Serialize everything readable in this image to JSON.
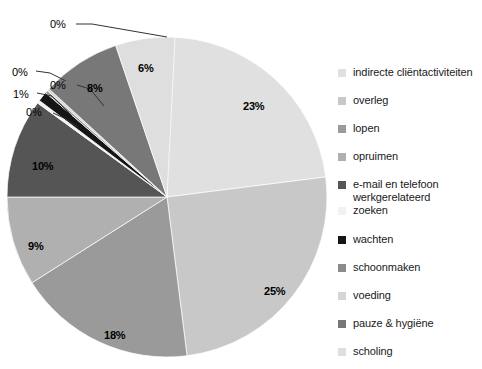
{
  "chart_data": {
    "type": "pie",
    "title": "",
    "legend_position": "right",
    "categories": [
      "indirecte cliëntactiviteiten",
      "overleg",
      "lopen",
      "opruimen",
      "e-mail en telefoon\nwerkgerelateerd",
      "zoeken",
      "wachten",
      "schoonmaken",
      "voeding",
      "pauze & hygiëne",
      "scholing"
    ],
    "values": [
      23,
      25,
      18,
      9,
      10,
      0,
      1,
      0,
      0,
      8,
      6
    ],
    "value_labels": [
      "23%",
      "25%",
      "18%",
      "9%",
      "10%",
      "0%",
      "1%",
      "0%",
      "0%",
      "8%",
      "6%"
    ],
    "colors": [
      "#e0e0e0",
      "#c8c8c8",
      "#9a9a9a",
      "#b0b0b0",
      "#555555",
      "#f2f2f2",
      "#151515",
      "#8c8c8c",
      "#d6d6d6",
      "#787878",
      "#dedede"
    ],
    "xlabel": "",
    "ylabel": "",
    "grid": false
  },
  "pie": {
    "slice_labels": [
      {
        "text": "23%",
        "x": 243,
        "y": 100
      },
      {
        "text": "25%",
        "x": 264,
        "y": 285
      },
      {
        "text": "18%",
        "x": 104,
        "y": 329
      },
      {
        "text": "9%",
        "x": 28,
        "y": 240
      },
      {
        "text": "10%",
        "x": 32,
        "y": 160
      },
      {
        "text": "8%",
        "x": 87,
        "y": 82
      },
      {
        "text": "6%",
        "x": 138,
        "y": 62
      }
    ],
    "callouts": [
      {
        "text": "0%",
        "x": 50,
        "y": 18
      },
      {
        "text": "0%",
        "x": 12,
        "y": 66
      },
      {
        "text": "0%",
        "x": 50,
        "y": 79
      },
      {
        "text": "1%",
        "x": 13,
        "y": 88
      },
      {
        "text": "0%",
        "x": 26,
        "y": 106
      }
    ]
  },
  "legend": {
    "items": [
      {
        "label": "indirecte cliëntactiviteiten",
        "color": "#e0e0e0",
        "top": 0
      },
      {
        "label": "overleg",
        "color": "#c8c8c8",
        "top": 28
      },
      {
        "label": "lopen",
        "color": "#9a9a9a",
        "top": 56
      },
      {
        "label": "opruimen",
        "color": "#b0b0b0",
        "top": 84
      },
      {
        "label": "e-mail en telefoon\nwerkgerelateerd",
        "color": "#555555",
        "top": 112
      },
      {
        "label": "zoeken",
        "color": "#f2f2f2",
        "top": 138
      },
      {
        "label": "wachten",
        "color": "#151515",
        "top": 167
      },
      {
        "label": "schoonmaken",
        "color": "#8c8c8c",
        "top": 195
      },
      {
        "label": "voeding",
        "color": "#d6d6d6",
        "top": 223
      },
      {
        "label": "pauze & hygiëne",
        "color": "#787878",
        "top": 251
      },
      {
        "label": "scholing",
        "color": "#dedede",
        "top": 279
      }
    ]
  }
}
